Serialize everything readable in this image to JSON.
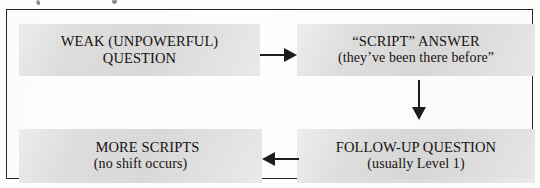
{
  "diagram": {
    "frame_border_color": "#262626",
    "node_fill_color": "#dedede",
    "arrow_color": "#1d1d1d",
    "nodes": [
      {
        "id": "weak-question",
        "line1": "WEAK (UNPOWERFUL)",
        "line2": "QUESTION"
      },
      {
        "id": "script-answer",
        "line1": "“SCRIPT” ANSWER",
        "line2": "(they’ve been there before”"
      },
      {
        "id": "more-scripts",
        "line1": "MORE SCRIPTS",
        "line2": "(no shift occurs)"
      },
      {
        "id": "followup-question",
        "line1": "FOLLOW-UP QUESTION",
        "line2": "(usually Level 1)"
      }
    ],
    "arrows": [
      {
        "id": "weak-to-script",
        "direction": "right",
        "from": "weak-question",
        "to": "script-answer"
      },
      {
        "id": "script-to-followup",
        "direction": "down",
        "from": "script-answer",
        "to": "followup-question"
      },
      {
        "id": "followup-to-more",
        "direction": "left",
        "from": "followup-question",
        "to": "more-scripts"
      }
    ]
  }
}
